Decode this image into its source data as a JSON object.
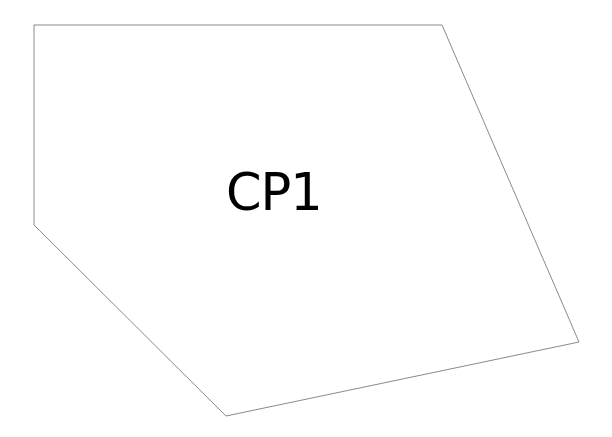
{
  "diagram": {
    "background": "#ffffff",
    "shape": {
      "type": "polygon",
      "label": "CP1",
      "stroke": "#8a8a8a",
      "fill": "#ffffff",
      "points": [
        [
          34,
          25
        ],
        [
          442,
          25
        ],
        [
          579,
          342
        ],
        [
          226,
          416
        ],
        [
          34,
          225
        ]
      ]
    }
  }
}
